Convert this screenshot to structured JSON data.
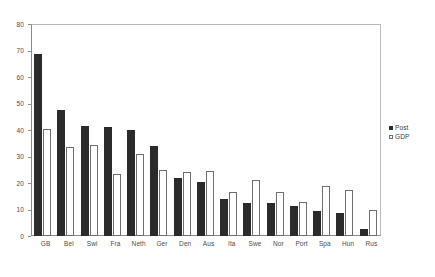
{
  "chart_data": {
    "type": "bar",
    "title": "",
    "xlabel": "",
    "ylabel": "",
    "ylim": [
      0,
      80
    ],
    "yticks": [
      0,
      10,
      20,
      30,
      40,
      50,
      60,
      70,
      80
    ],
    "grid": false,
    "legend_position": "right",
    "categories": [
      "GB",
      "Bel",
      "Swi",
      "Fra",
      "Neth",
      "Ger",
      "Den",
      "Aus",
      "Ita",
      "Swe",
      "Nor",
      "Port",
      "Spa",
      "Hun",
      "Rus"
    ],
    "series": [
      {
        "name": "Post",
        "color": "#2b2b2b",
        "style": "filled",
        "values": [
          68.5,
          47.5,
          41.5,
          41,
          40,
          34,
          22,
          20.5,
          14,
          12.5,
          12.5,
          11.5,
          9.5,
          8.5,
          2.5
        ]
      },
      {
        "name": "GDP",
        "color": "#ffffff",
        "style": "open",
        "values": [
          40.5,
          33.5,
          34.5,
          23.5,
          31,
          25,
          24,
          24.5,
          16.5,
          21,
          16.5,
          13,
          19,
          17.5,
          10
        ]
      }
    ]
  },
  "legend": {
    "items": [
      {
        "label": "Post",
        "swatch": "filled-square-icon"
      },
      {
        "label": "GDP",
        "swatch": "open-square-icon"
      }
    ]
  }
}
